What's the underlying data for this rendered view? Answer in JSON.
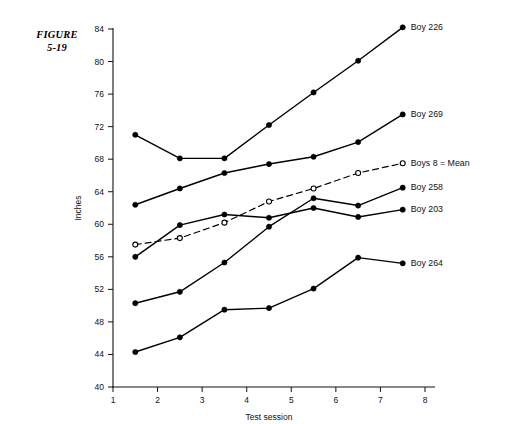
{
  "figure": {
    "label_line1": "FIGURE",
    "label_line2": "5-19"
  },
  "chart_data": {
    "type": "line",
    "title": "",
    "subtitle": "",
    "xlabel": "Test session",
    "ylabel": "Inches",
    "xlim": [
      1,
      8
    ],
    "ylim": [
      40,
      84
    ],
    "xticks": [
      1,
      2,
      3,
      4,
      5,
      6,
      7,
      8
    ],
    "yticks": [
      40,
      44,
      48,
      52,
      56,
      60,
      64,
      68,
      72,
      76,
      80,
      84
    ],
    "xtick_labels": [
      "1",
      "2",
      "3",
      "4",
      "5",
      "6",
      "7",
      "8"
    ],
    "ytick_labels": [
      "40",
      "44",
      "48",
      "52",
      "56",
      "60",
      "64",
      "68",
      "72",
      "76",
      "80",
      "84"
    ],
    "grid": false,
    "legend_position": "right-inline-endpoint-labels",
    "x": [
      1.5,
      2.5,
      3.5,
      4.5,
      5.5,
      6.5,
      7.5
    ],
    "series": [
      {
        "name": "Boy 226",
        "label": "Boy 226",
        "marker": "filled-circle",
        "linestyle": "solid",
        "color": "#000000",
        "values": [
          71.0,
          68.1,
          68.1,
          72.2,
          76.2,
          80.1,
          84.2
        ]
      },
      {
        "name": "Boy 269",
        "label": "Boy 269",
        "marker": "filled-circle",
        "linestyle": "solid",
        "color": "#000000",
        "values": [
          62.4,
          64.4,
          66.3,
          67.4,
          68.3,
          70.1,
          73.5
        ]
      },
      {
        "name": "Boys 8 = Mean",
        "label": "Boys 8 = Mean",
        "marker": "open-circle",
        "linestyle": "dashed",
        "color": "#000000",
        "values": [
          57.5,
          58.3,
          60.2,
          62.8,
          64.4,
          66.3,
          67.5
        ]
      },
      {
        "name": "Boy 258",
        "label": "Boy 258",
        "marker": "filled-circle",
        "linestyle": "solid",
        "color": "#000000",
        "values": [
          50.3,
          51.7,
          55.3,
          59.7,
          63.2,
          62.3,
          64.5
        ]
      },
      {
        "name": "Boy 203",
        "label": "Boy 203",
        "marker": "filled-circle",
        "linestyle": "solid",
        "color": "#000000",
        "values": [
          56.0,
          59.9,
          61.2,
          60.8,
          62.0,
          60.9,
          61.8
        ]
      },
      {
        "name": "Boy 264",
        "label": "Boy 264",
        "marker": "filled-circle",
        "linestyle": "solid",
        "color": "#000000",
        "values": [
          44.3,
          46.1,
          49.5,
          49.7,
          52.1,
          55.9,
          55.2
        ]
      }
    ],
    "series_label_positions": [
      {
        "label": "Boy 226",
        "y_value": 84.2
      },
      {
        "label": "Boy 269",
        "y_value": 73.5
      },
      {
        "label": "Boys 8 = Mean",
        "y_value": 67.5
      },
      {
        "label": "Boy 258",
        "y_value": 64.5
      },
      {
        "label": "Boy 203",
        "y_value": 61.8
      },
      {
        "label": "Boy 264",
        "y_value": 55.2
      }
    ]
  }
}
